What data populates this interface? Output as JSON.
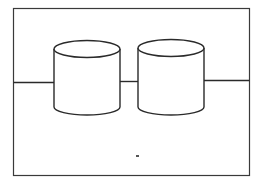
{
  "diagram": {
    "nodes": [
      {
        "id": "cylinder-1",
        "shape": "cylinder",
        "label": ""
      },
      {
        "id": "cylinder-2",
        "shape": "cylinder",
        "label": ""
      }
    ],
    "edges": [
      {
        "from": "frame-left",
        "to": "cylinder-1"
      },
      {
        "from": "cylinder-1",
        "to": "cylinder-2"
      },
      {
        "from": "cylinder-2",
        "to": "frame-right"
      }
    ],
    "colors": {
      "stroke": "#2a2a2a",
      "background": "#ffffff"
    }
  }
}
